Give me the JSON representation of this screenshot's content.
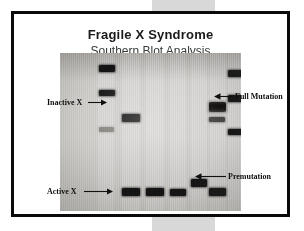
{
  "figure": {
    "title": "Fragile X Syndrome",
    "subtitle": "Southern Blot Analysis",
    "frame_color": "#0a0a0a",
    "background_color": "#ffffff",
    "gel_background_color": "#d3d1ce",
    "band_color": "#151515"
  },
  "annotations": [
    {
      "id": "inactive-x",
      "label": "Inactive X",
      "side": "left",
      "arrow": "right"
    },
    {
      "id": "full-mutation",
      "label": "Full Mutation",
      "side": "right",
      "arrow": "left"
    },
    {
      "id": "premutation",
      "label": "Premutation",
      "side": "right",
      "arrow": "left"
    },
    {
      "id": "active-x",
      "label": "Active X",
      "side": "left",
      "arrow": "right"
    }
  ],
  "gel": {
    "lane_count": 7,
    "lanes": [
      {
        "index": 1,
        "name": "size-marker-left",
        "bands": 3
      },
      {
        "index": 2,
        "name": "sample-lane-2",
        "bands": 1
      },
      {
        "index": 3,
        "name": "sample-lane-3",
        "bands": 2
      },
      {
        "index": 4,
        "name": "sample-lane-4",
        "bands": 1
      },
      {
        "index": 5,
        "name": "sample-lane-5",
        "bands": 1
      },
      {
        "index": 6,
        "name": "sample-lane-6",
        "bands": 3
      },
      {
        "index": 7,
        "name": "size-marker-right",
        "bands": 3
      }
    ]
  }
}
